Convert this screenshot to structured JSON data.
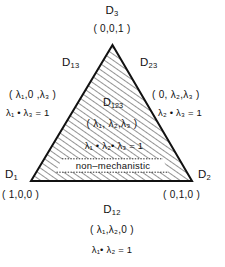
{
  "figure": {
    "type": "ternary-simplex-diagram"
  },
  "vertices": {
    "top": {
      "name": "D3",
      "label_main": "D",
      "label_sub": "3",
      "coords": "( 0,0,1 )"
    },
    "bottom_left": {
      "name": "D1",
      "label_main": "D",
      "label_sub": "1",
      "coords": "( 1,0,0 )"
    },
    "bottom_right": {
      "name": "D2",
      "label_main": "D",
      "label_sub": "2",
      "coords": "( 0,1,0 )"
    }
  },
  "edges": {
    "left": {
      "name": "D13",
      "label_main": "D",
      "label_sub": "13",
      "coords": "( λ₁,0 ,λ₃ )",
      "equation": "λ₁ • λ₃ = 1"
    },
    "right": {
      "name": "D23",
      "label_main": "D",
      "label_sub": "23",
      "coords": "( 0, λ₂,λ₃ )",
      "equation": "λ₂ • λ₃ = 1"
    },
    "bottom": {
      "name": "D12",
      "label_main": "D",
      "label_sub": "12",
      "coords": "( λ₁,λ₂,0 )",
      "equation": "λ₁• λ₂ = 1"
    }
  },
  "interior": {
    "name": "D123",
    "label_main": "D",
    "label_sub": "123",
    "coords": "( λ₁, λ₂,λ₃ )",
    "equation": "λ₁ • λ₂• λ₃ = 1",
    "band_label": "non–mechanistic"
  },
  "colors": {
    "stroke": "#111111",
    "hatch": "#3a3a3a",
    "background": "#ffffff",
    "text": "#111111"
  }
}
